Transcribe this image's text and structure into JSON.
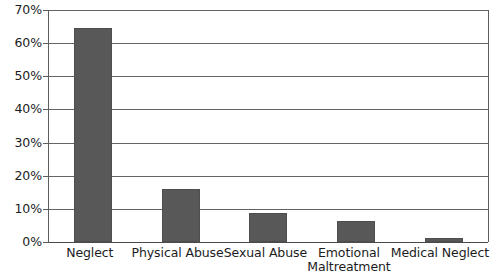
{
  "chart_data": {
    "type": "bar",
    "title": "",
    "subtitle": "",
    "xlabel": "",
    "ylabel": "",
    "categories": [
      "Neglect",
      "Physical Abuse",
      "Sexual Abuse",
      "Emotional Maltreatment",
      "Medical Neglect"
    ],
    "category_lines": [
      [
        "Neglect"
      ],
      [
        "Physical Abuse"
      ],
      [
        "Sexual Abuse"
      ],
      [
        "Emotional",
        "Maltreatment"
      ],
      [
        "Medical Neglect"
      ]
    ],
    "values": [
      64.5,
      16.0,
      8.8,
      6.3,
      1.3
    ],
    "value_unit": "%",
    "ylim": [
      0,
      70
    ],
    "ytick_step": 10,
    "ytick_labels": [
      "70%",
      "60%",
      "50%",
      "40%",
      "30%",
      "20%",
      "10%",
      "0%"
    ],
    "ytick_values": [
      70,
      60,
      50,
      40,
      30,
      20,
      10,
      0
    ],
    "grid": true,
    "grid_axis": "y",
    "legend": false,
    "legend_position": "none",
    "bar_color": "#585858",
    "grid_color": "#636363",
    "axis_color": "#5d5d5d",
    "background_color": "#ffffff",
    "text_color": "#1c1c1c"
  }
}
